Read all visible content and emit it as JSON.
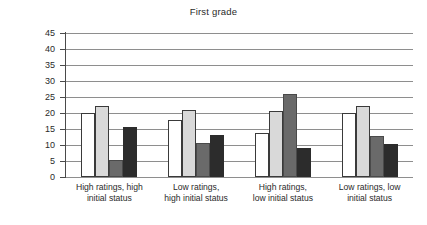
{
  "chart_data": {
    "type": "bar",
    "title": "First grade",
    "xlabel": "",
    "ylabel": "Percentage of time",
    "ylim": [
      0,
      45
    ],
    "ytick_labels": [
      "0",
      "5",
      "10",
      "15",
      "20",
      "25",
      "30",
      "35",
      "40",
      "45"
    ],
    "yticks": [
      0,
      5,
      10,
      15,
      20,
      25,
      30,
      35,
      40,
      45
    ],
    "grid": true,
    "legend": false,
    "legend_position": "none",
    "categories": [
      "High ratings, high initial status",
      "Low ratings, high initial status",
      "High ratings, low initial status",
      "Low ratings, low initial status"
    ],
    "category_lines": [
      [
        "High ratings, high",
        "initial status"
      ],
      [
        "Low ratings,",
        "high initial status"
      ],
      [
        "High ratings,",
        "low initial status"
      ],
      [
        "Low ratings, low",
        "initial status"
      ]
    ],
    "series": [
      {
        "name": "series-1",
        "color": "#ffffff",
        "values": [
          20.0,
          17.7,
          13.7,
          20.1
        ]
      },
      {
        "name": "series-2",
        "color": "#d9d9d9",
        "values": [
          22.3,
          21.0,
          20.6,
          22.2
        ]
      },
      {
        "name": "series-3",
        "color": "#6a6a6a",
        "values": [
          5.3,
          10.6,
          25.8,
          12.8
        ]
      },
      {
        "name": "series-4",
        "color": "#2c2c2c",
        "values": [
          15.5,
          13.0,
          9.2,
          10.2
        ]
      }
    ]
  }
}
